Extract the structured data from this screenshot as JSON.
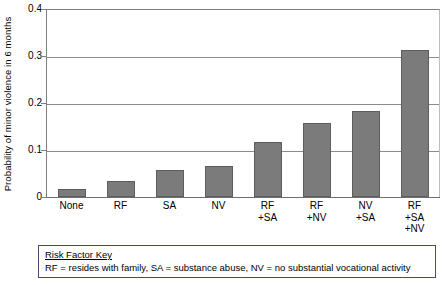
{
  "chart_data": {
    "type": "bar",
    "title": "",
    "xlabel": "",
    "ylabel": "Probability of minor violence in 6 months",
    "categories": [
      "None",
      "RF",
      "SA",
      "NV",
      "RF +SA",
      "RF +NV",
      "NV +SA",
      "RF +SA +NV"
    ],
    "category_lines": [
      [
        "None"
      ],
      [
        "RF"
      ],
      [
        "SA"
      ],
      [
        "NV"
      ],
      [
        "RF",
        "+SA"
      ],
      [
        "RF",
        "+NV"
      ],
      [
        "NV",
        "+SA"
      ],
      [
        "RF",
        "+SA",
        "+NV"
      ]
    ],
    "values": [
      0.017,
      0.035,
      0.057,
      0.065,
      0.118,
      0.157,
      0.184,
      0.312
    ],
    "ylim": [
      0,
      0.4
    ],
    "ytick_values": [
      0.4,
      0.3,
      0.2,
      0.1,
      0
    ],
    "ytick_labels": [
      "0.4",
      "0.3",
      "0.2",
      "0.1",
      "0"
    ],
    "grid": true,
    "legend": "none",
    "bar_color": "#7b7b7b",
    "bar_edge_color": "#5d5d5d",
    "gridline_color": "#8c8c8c",
    "axis_color": "#6e6e6e"
  },
  "key_box": {
    "title": "Risk Factor Key",
    "text": "RF = resides with family, SA = substance abuse, NV = no substantial vocational activity",
    "border_color": "#4a4a78"
  }
}
